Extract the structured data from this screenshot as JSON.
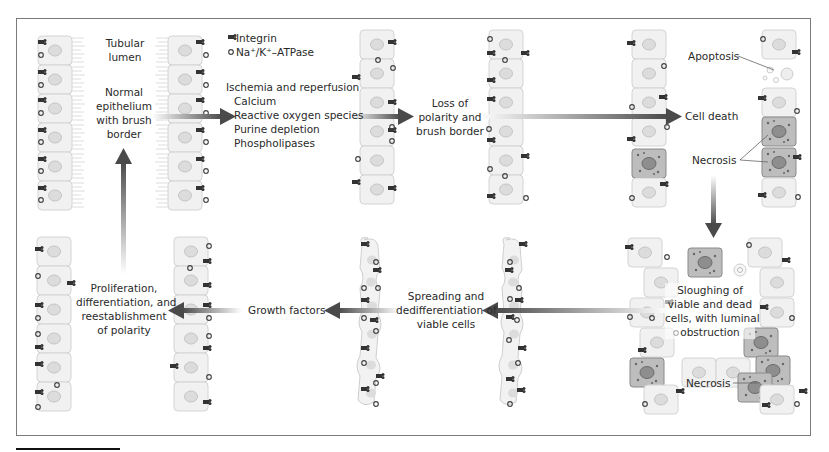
{
  "legend": {
    "integrin": "Integrin",
    "atpase": "Na⁺/K⁺–ATPase"
  },
  "labels": {
    "tubular_lumen": [
      "Tubular",
      "lumen"
    ],
    "normal_epithelium": [
      "Normal",
      "epithelium",
      "with brush",
      "border"
    ],
    "insults": {
      "title": "Ischemia and reperfusion",
      "items": [
        "Calcium",
        "Reactive oxygen species",
        "Purine depletion",
        "Phospholipases"
      ]
    },
    "loss_polarity": [
      "Loss of",
      "polarity and",
      "brush border"
    ],
    "cell_death": "Cell death",
    "apoptosis": "Apoptosis",
    "necrosis_top": "Necrosis",
    "sloughing": [
      "Sloughing of",
      "viable and dead",
      "cells, with luminal",
      "obstruction"
    ],
    "necrosis_bottom": "Necrosis",
    "spreading": [
      "Spreading and",
      "dedifferentiation of",
      "viable cells"
    ],
    "growth_factors": "Growth factors",
    "proliferation": [
      "Proliferation,",
      "differentiation, and",
      "reestablishment",
      "of polarity"
    ]
  },
  "colors": {
    "cell_fill": "#f0f0f0",
    "cell_stroke": "#d6d6d6",
    "nucleus": "#d9d9d9",
    "necrotic_fill": "#b8b8b8",
    "arrow_dark": "#555555",
    "frame": "#7a7a7a"
  }
}
